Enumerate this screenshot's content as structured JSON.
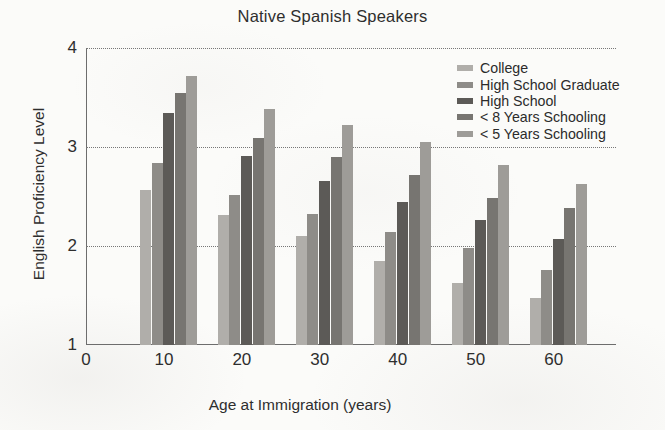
{
  "chart_data": {
    "type": "bar",
    "title": "Native Spanish Speakers",
    "xlabel": "Age at Immigration (years)",
    "ylabel": "English Proficiency Level",
    "grid": true,
    "grid_axis": "y",
    "grid_style": "dotted",
    "legend_position": "top-right-inside",
    "categories": [
      "10",
      "20",
      "30",
      "40",
      "50",
      "60"
    ],
    "x": [
      10,
      20,
      30,
      40,
      50,
      60
    ],
    "xlim": [
      0,
      68
    ],
    "ylim": [
      1,
      4
    ],
    "xticks": [
      "0",
      "10",
      "20",
      "30",
      "40",
      "50",
      "60"
    ],
    "xtick_values": [
      0,
      10,
      20,
      30,
      40,
      50,
      60
    ],
    "yticks": [
      "1",
      "2",
      "3",
      "4"
    ],
    "ytick_values": [
      1,
      2,
      3,
      4
    ],
    "gridline_values": [
      2,
      3,
      4
    ],
    "series": [
      {
        "name": "College",
        "color": "#b0aeaa",
        "values": [
          2.57,
          2.31,
          2.1,
          1.85,
          1.63,
          1.47
        ]
      },
      {
        "name": "High School Graduate",
        "color": "#8e8c88",
        "values": [
          2.84,
          2.52,
          2.32,
          2.14,
          1.98,
          1.76
        ]
      },
      {
        "name": "High School",
        "color": "#5c5a57",
        "values": [
          3.34,
          2.91,
          2.66,
          2.44,
          2.26,
          2.07
        ]
      },
      {
        "name": "< 8 Years Schooling",
        "color": "#777571",
        "values": [
          3.55,
          3.09,
          2.9,
          2.72,
          2.48,
          2.38
        ]
      },
      {
        "name": "< 5 Years Schooling",
        "color": "#9e9c98",
        "values": [
          3.72,
          3.38,
          3.22,
          3.05,
          2.82,
          2.63
        ]
      }
    ]
  },
  "legend": {
    "items": [
      {
        "label": "College",
        "color": "#b0aeaa"
      },
      {
        "label": "High School Graduate",
        "color": "#8e8c88"
      },
      {
        "label": "High School",
        "color": "#5c5a57"
      },
      {
        "label": "< 8 Years Schooling",
        "color": "#777571"
      },
      {
        "label": "< 5 Years Schooling",
        "color": "#9e9c98"
      }
    ]
  },
  "style": {
    "axis_color": "#6d6d6d",
    "grid_color": "#777777",
    "text_color": "#2e2e2e",
    "background": "#fbfbf9"
  }
}
